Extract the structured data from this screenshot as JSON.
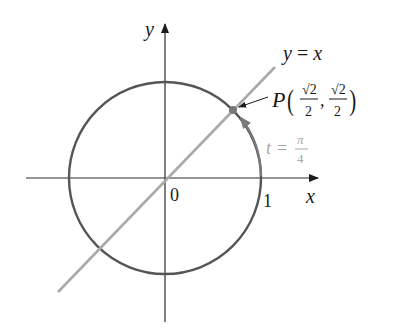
{
  "diagram": {
    "type": "unit-circle",
    "axes": {
      "x_label": "x",
      "y_label": "y",
      "origin_label": "0",
      "tick_x_label": "1"
    },
    "line": {
      "label": "y = x"
    },
    "point": {
      "name": "P",
      "x_num": "√2",
      "x_den": "2",
      "y_num": "√2",
      "y_den": "2",
      "separator": ","
    },
    "angle": {
      "lhs": "t =",
      "num": "π",
      "den": "4"
    },
    "colors": {
      "axes": "#2a2a2a",
      "circle": "#555555",
      "line": "#aaaaaa",
      "point": "#777777",
      "angle_label": "#a8a8a8",
      "text": "#1a1a1a"
    }
  }
}
